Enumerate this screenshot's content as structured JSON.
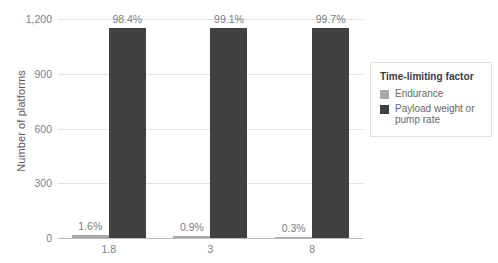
{
  "chart_data": {
    "type": "bar",
    "title": "",
    "subtitle": "",
    "xlabel": "",
    "ylabel": "Number of platforms",
    "categories": [
      "1.8",
      "3",
      "8"
    ],
    "ylim": [
      0,
      1200
    ],
    "yticks": [
      "0",
      "300",
      "600",
      "900",
      "1,200"
    ],
    "ytick_values": [
      0,
      300,
      600,
      900,
      1200
    ],
    "grid": true,
    "legend_position": "right",
    "legend_title": "Time-limiting factor",
    "series": [
      {
        "name": "Endurance",
        "color": "#a9a9ac",
        "values": [
          19,
          10,
          3
        ],
        "labels": [
          "1.6%",
          "0.9%",
          "0.3%"
        ]
      },
      {
        "name": "Payload weight or pump rate",
        "color": "#414143",
        "values": [
          1150,
          1150,
          1150
        ],
        "labels": [
          "98.4%",
          "99.1%",
          "99.7%"
        ]
      }
    ]
  },
  "legend": {
    "title": "Time-limiting factor",
    "items": [
      {
        "label": "Endurance",
        "color": "#a9a9ac"
      },
      {
        "label": "Payload weight or pump rate",
        "color": "#414143"
      }
    ]
  },
  "axes": {
    "y_title": "Number of platforms"
  }
}
